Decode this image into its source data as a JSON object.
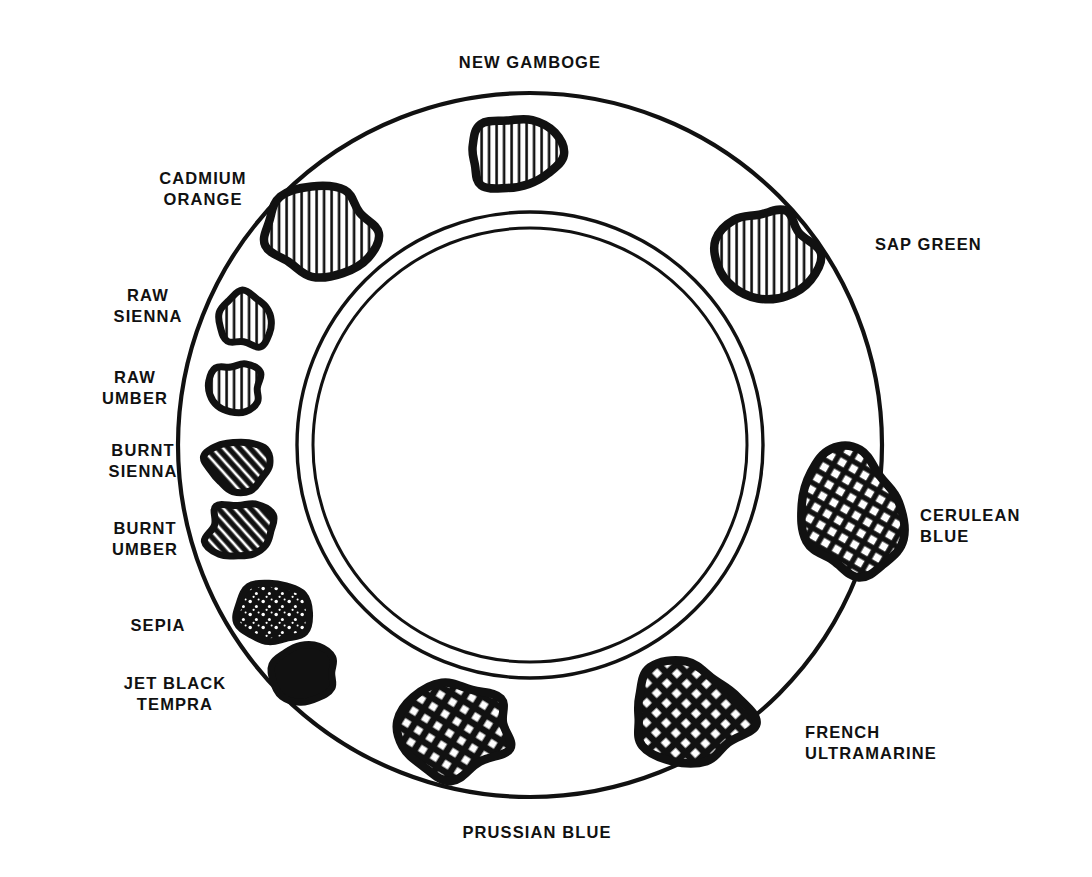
{
  "figure": {
    "kind": "palette-wheel-diagram",
    "line_color": "#111111",
    "background_color": "#ffffff"
  },
  "ring": {
    "outer_circle": {
      "cx": 530,
      "cy": 445,
      "r": 352
    },
    "inner_circle_outer": {
      "cx": 530,
      "cy": 445,
      "r": 233
    },
    "inner_circle_inner": {
      "cx": 530,
      "cy": 445,
      "r": 217
    }
  },
  "labels": [
    {
      "id": "new-gamboge",
      "text": "NEW GAMBOGE",
      "x": 530,
      "y": 52,
      "align": "center"
    },
    {
      "id": "cadmium-orange",
      "text": "CADMIUM\nORANGE",
      "x": 203,
      "y": 168,
      "align": "center"
    },
    {
      "id": "raw-sienna",
      "text": "RAW\nSIENNA",
      "x": 148,
      "y": 285,
      "align": "center"
    },
    {
      "id": "raw-umber",
      "text": "RAW\nUMBER",
      "x": 135,
      "y": 367,
      "align": "center"
    },
    {
      "id": "burnt-sienna",
      "text": "BURNT\nSIENNA",
      "x": 143,
      "y": 440,
      "align": "center"
    },
    {
      "id": "burnt-umber",
      "text": "BURNT\nUMBER",
      "x": 145,
      "y": 518,
      "align": "center"
    },
    {
      "id": "sepia",
      "text": "SEPIA",
      "x": 158,
      "y": 615,
      "align": "center"
    },
    {
      "id": "jet-black-tempra",
      "text": "JET BLACK\nTEMPRA",
      "x": 175,
      "y": 673,
      "align": "center"
    },
    {
      "id": "prussian-blue",
      "text": "PRUSSIAN BLUE",
      "x": 537,
      "y": 822,
      "align": "center"
    },
    {
      "id": "french-ultramarine",
      "text": "FRENCH\nULTRAMARINE",
      "x": 805,
      "y": 722,
      "align": "left"
    },
    {
      "id": "cerulean-blue",
      "text": "CERULEAN\nBLUE",
      "x": 920,
      "y": 505,
      "align": "left"
    },
    {
      "id": "sap-green",
      "text": "SAP GREEN",
      "x": 875,
      "y": 234,
      "align": "left"
    }
  ],
  "blobs": [
    {
      "id": "blob-new-gamboge",
      "pigment": "NEW GAMBOGE",
      "cx": 513,
      "cy": 155,
      "rx": 46,
      "ry": 38,
      "fill": "vertical-hatch",
      "seed": 11,
      "rot": 0
    },
    {
      "id": "blob-sap-green",
      "pigment": "SAP GREEN",
      "cx": 765,
      "cy": 253,
      "rx": 50,
      "ry": 46,
      "fill": "vertical-hatch",
      "seed": 23,
      "rot": 0
    },
    {
      "id": "blob-cerulean-blue",
      "pigment": "CERULEAN BLUE",
      "cx": 852,
      "cy": 512,
      "rx": 47,
      "ry": 61,
      "fill": "cross-hatch",
      "seed": 37,
      "rot": -12
    },
    {
      "id": "blob-french-ultramarine",
      "pigment": "FRENCH ULTRAMARINE",
      "cx": 688,
      "cy": 714,
      "rx": 61,
      "ry": 49,
      "fill": "dense-cross",
      "seed": 41,
      "rot": 8
    },
    {
      "id": "blob-prussian-blue",
      "pigment": "PRUSSIAN BLUE",
      "cx": 455,
      "cy": 728,
      "rx": 60,
      "ry": 47,
      "fill": "dense-cross",
      "seed": 53,
      "rot": -6
    },
    {
      "id": "blob-jet-black-tempra",
      "pigment": "JET BLACK TEMPRA",
      "cx": 305,
      "cy": 673,
      "rx": 33,
      "ry": 29,
      "fill": "solid-black",
      "seed": 59,
      "rot": 0
    },
    {
      "id": "blob-sepia",
      "pigment": "SEPIA",
      "cx": 273,
      "cy": 613,
      "rx": 35,
      "ry": 33,
      "fill": "speckled-black",
      "seed": 67,
      "rot": 0
    },
    {
      "id": "blob-burnt-umber",
      "pigment": "BURNT UMBER",
      "cx": 242,
      "cy": 532,
      "rx": 35,
      "ry": 30,
      "fill": "diagonal-hatch",
      "seed": 71,
      "rot": 0
    },
    {
      "id": "blob-burnt-sienna",
      "pigment": "BURNT SIENNA",
      "cx": 237,
      "cy": 465,
      "rx": 31,
      "ry": 27,
      "fill": "diagonal-hatch",
      "seed": 79,
      "rot": 0
    },
    {
      "id": "blob-raw-umber",
      "pigment": "RAW UMBER",
      "cx": 234,
      "cy": 388,
      "rx": 28,
      "ry": 26,
      "fill": "vertical-hatch",
      "seed": 83,
      "rot": 0
    },
    {
      "id": "blob-raw-sienna",
      "pigment": "RAW SIENNA",
      "cx": 247,
      "cy": 320,
      "rx": 29,
      "ry": 27,
      "fill": "vertical-hatch",
      "seed": 89,
      "rot": 0
    },
    {
      "id": "blob-cadmium-orange",
      "pigment": "CADMIUM ORANGE",
      "cx": 320,
      "cy": 233,
      "rx": 55,
      "ry": 44,
      "fill": "vertical-hatch",
      "seed": 97,
      "rot": 0
    }
  ]
}
